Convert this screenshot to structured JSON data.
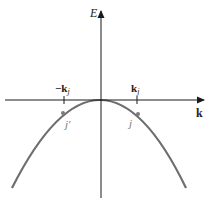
{
  "diagram": {
    "type": "band-structure-sketch",
    "axes": {
      "vertical_label": "E",
      "horizontal_label": "k"
    },
    "ticks": [
      {
        "label_main": "−k",
        "label_sub": "j",
        "side": "negative"
      },
      {
        "label_main": "k",
        "label_sub": "j",
        "side": "positive"
      }
    ],
    "points": [
      {
        "label": "j′",
        "side": "negative"
      },
      {
        "label": "j",
        "side": "positive"
      }
    ],
    "curve": {
      "shape": "downward parabola",
      "color": "#6e6e6e"
    },
    "colors": {
      "axis": "#1a1a1a",
      "curve": "#6e6e6e",
      "point": "#7a7a7a",
      "background": "#ffffff"
    }
  }
}
